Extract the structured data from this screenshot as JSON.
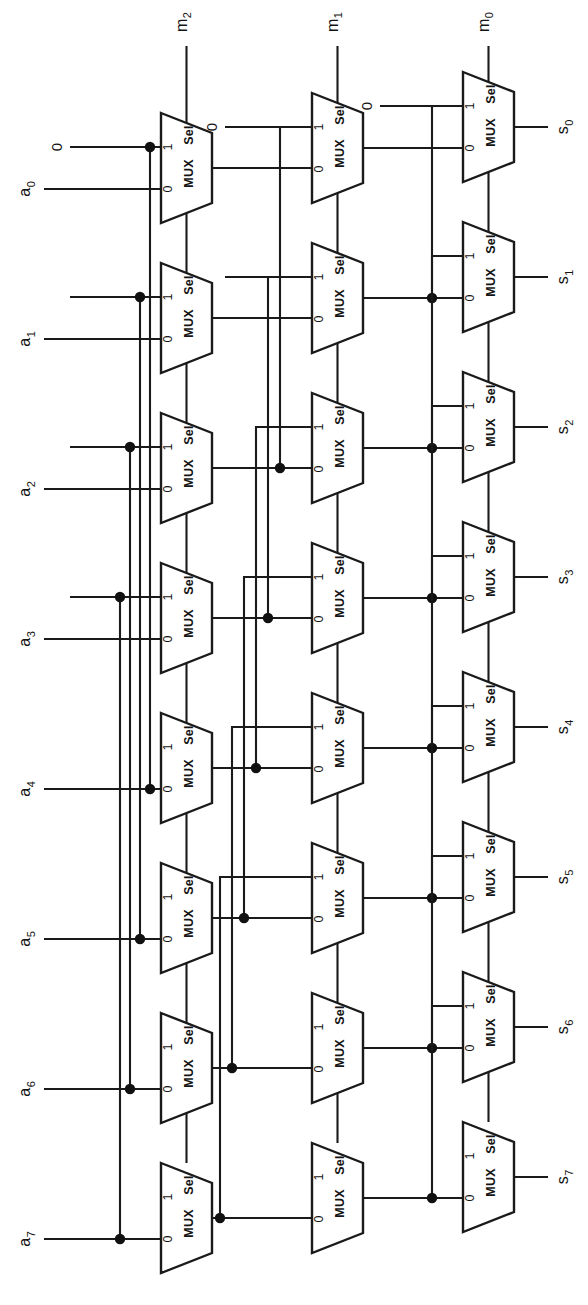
{
  "figure": {
    "kind": "schematic",
    "orientation_deg": 90,
    "background_color": "#ffffff",
    "line_color": "#1a1a1a",
    "dot_color": "#111111"
  },
  "labels": {
    "mux_name": "MUX",
    "sel_name": "Sel",
    "pin_one": "1",
    "pin_zero": "0",
    "const_zero": "0"
  },
  "inputs": {
    "data_base": "a",
    "data": [
      {
        "name": "a0",
        "base": "a",
        "sub": "0"
      },
      {
        "name": "a1",
        "base": "a",
        "sub": "1"
      },
      {
        "name": "a2",
        "base": "a",
        "sub": "2"
      },
      {
        "name": "a3",
        "base": "a",
        "sub": "3"
      },
      {
        "name": "a4",
        "base": "a",
        "sub": "4"
      },
      {
        "name": "a5",
        "base": "a",
        "sub": "5"
      },
      {
        "name": "a6",
        "base": "a",
        "sub": "6"
      },
      {
        "name": "a7",
        "base": "a",
        "sub": "7"
      }
    ],
    "selects": [
      {
        "name": "m2",
        "base": "m",
        "sub": "2",
        "stage": 0,
        "shift": 4
      },
      {
        "name": "m1",
        "base": "m",
        "sub": "1",
        "stage": 1,
        "shift": 2
      },
      {
        "name": "m0",
        "base": "m",
        "sub": "0",
        "stage": 2,
        "shift": 1
      }
    ]
  },
  "outputs": {
    "data_base": "s",
    "data": [
      {
        "name": "s0",
        "base": "s",
        "sub": "0"
      },
      {
        "name": "s1",
        "base": "s",
        "sub": "1"
      },
      {
        "name": "s2",
        "base": "s",
        "sub": "2"
      },
      {
        "name": "s3",
        "base": "s",
        "sub": "3"
      },
      {
        "name": "s4",
        "base": "s",
        "sub": "4"
      },
      {
        "name": "s5",
        "base": "s",
        "sub": "5"
      },
      {
        "name": "s6",
        "base": "s",
        "sub": "6"
      },
      {
        "name": "s7",
        "base": "s",
        "sub": "7"
      }
    ]
  },
  "stages": [
    {
      "index": 0,
      "select": "m2",
      "shift": 4,
      "mux_count": 8,
      "zero_fed_rows": [
        0,
        1,
        2,
        3
      ],
      "note": "row i input 1 = a[i+4], rows 0-3 fed constant 0"
    },
    {
      "index": 1,
      "select": "m1",
      "shift": 2,
      "mux_count": 8,
      "zero_fed_rows": [
        0,
        1
      ],
      "note": "row i input 1 = stage0 out[i+2], rows 0-1 fed constant 0"
    },
    {
      "index": 2,
      "select": "m0",
      "shift": 1,
      "mux_count": 8,
      "zero_fed_rows": [
        0
      ],
      "note": "row i input 1 = stage1 out[i+1], row 0 fed constant 0"
    }
  ],
  "geometry": {
    "rows": 8,
    "row_pitch": 150,
    "stage_x": [
      161,
      312,
      463
    ],
    "stage_y0": [
      113,
      93,
      72
    ],
    "mux_width": 51,
    "mux_height": 110
  }
}
